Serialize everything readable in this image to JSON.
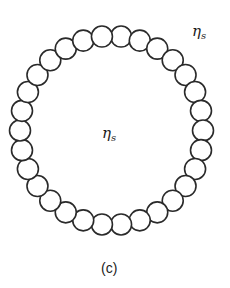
{
  "figure": {
    "caption": "(c)",
    "labels": {
      "outer_symbol": "η",
      "outer_subscript": "s",
      "inner_symbol": "η",
      "inner_subscript": "s"
    },
    "ring": {
      "bead_count": 30,
      "center_x": 111.5,
      "center_y": 130.5,
      "radius_x": 91.5,
      "radius_y": 94.5,
      "bead_radius": 10.5,
      "stroke_color": "#2a2a2a",
      "fill_color": "#ffffff"
    }
  }
}
